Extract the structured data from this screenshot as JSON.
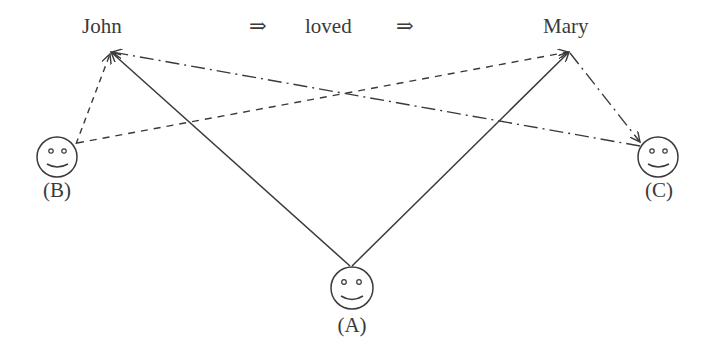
{
  "sentence": {
    "subject": "John",
    "arrow1": "⇒",
    "verb": "loved",
    "arrow2": "⇒",
    "object": "Mary"
  },
  "agents": [
    {
      "id": "A",
      "label": "(A)",
      "icon": "smiley-face-icon",
      "link_style": "solid"
    },
    {
      "id": "B",
      "label": "(B)",
      "icon": "smiley-face-icon",
      "link_style": "dashed"
    },
    {
      "id": "C",
      "label": "(C)",
      "icon": "smiley-face-icon",
      "link_style": "dash-dot"
    }
  ],
  "edges": [
    {
      "from": "A",
      "to": "John",
      "style": "solid",
      "arrow": "John"
    },
    {
      "from": "A",
      "to": "Mary",
      "style": "solid",
      "arrow": "Mary"
    },
    {
      "from": "B",
      "to": "John",
      "style": "dashed",
      "arrow": "John"
    },
    {
      "from": "B",
      "to": "Mary",
      "style": "dashed",
      "arrow": "Mary"
    },
    {
      "from": "C",
      "to": "John",
      "style": "dash-dot",
      "arrow": "John"
    },
    {
      "from": "Mary",
      "to": "C",
      "style": "dash-dot",
      "arrow": "C"
    }
  ],
  "colors": {
    "stroke": "#3a3a3a",
    "background": "#ffffff"
  }
}
